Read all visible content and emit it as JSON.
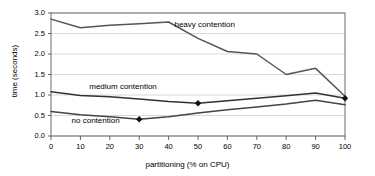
{
  "chart_data": {
    "type": "line",
    "title": "",
    "xlabel": "partitioning (% on CPU)",
    "ylabel": "time (seconds)",
    "xlim": [
      0,
      100
    ],
    "ylim": [
      0.0,
      3.0
    ],
    "xticks": [
      "0",
      "10",
      "20",
      "30",
      "40",
      "50",
      "60",
      "70",
      "80",
      "90",
      "100"
    ],
    "yticks": [
      "0.0",
      "0.5",
      "1.0",
      "1.5",
      "2.0",
      "2.5",
      "3.0"
    ],
    "grid": "horizontal",
    "legend_position": "inline-annotations",
    "x": [
      0,
      10,
      20,
      30,
      40,
      50,
      60,
      70,
      80,
      90,
      100
    ],
    "series": [
      {
        "name": "heavy contention",
        "color": "#555555",
        "values": [
          2.85,
          2.64,
          2.7,
          2.74,
          2.78,
          2.38,
          2.06,
          2.0,
          1.5,
          1.65,
          0.97
        ],
        "markers": []
      },
      {
        "name": "medium contention",
        "color": "#333333",
        "values": [
          1.08,
          0.99,
          0.96,
          0.9,
          0.84,
          0.8,
          0.86,
          0.92,
          0.98,
          1.05,
          0.92
        ],
        "markers": [
          {
            "x": 50,
            "y": 0.8
          },
          {
            "x": 100,
            "y": 0.92
          }
        ]
      },
      {
        "name": "no contention",
        "color": "#444444",
        "values": [
          0.6,
          0.52,
          0.47,
          0.41,
          0.47,
          0.56,
          0.64,
          0.71,
          0.78,
          0.87,
          0.76
        ],
        "markers": [
          {
            "x": 30,
            "y": 0.41
          }
        ]
      }
    ],
    "annotations": [
      {
        "text": "heavy contention",
        "x": 42,
        "y": 2.68
      },
      {
        "text": "medium contention",
        "x": 13,
        "y": 1.18
      },
      {
        "text": "no contention",
        "x": 7,
        "y": 0.33
      }
    ]
  }
}
